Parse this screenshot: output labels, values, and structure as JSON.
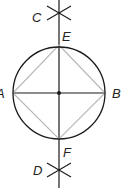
{
  "diagram": {
    "labels": {
      "A": "A",
      "B": "B",
      "C": "C",
      "D": "D",
      "E": "E",
      "F": "F"
    },
    "colors": {
      "line": "#1a1a1a",
      "square": "#b8b8b8"
    }
  }
}
